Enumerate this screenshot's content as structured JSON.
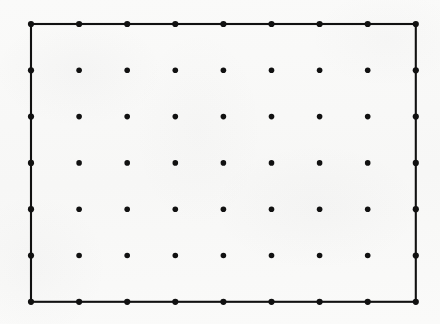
{
  "figure": {
    "kind": "lattice-rectangle-diagram",
    "canvas": {
      "width": 440,
      "height": 324
    },
    "background_color": "#f9f9f8",
    "ink_color": "#111111",
    "lattice": {
      "columns": 9,
      "rows": 7,
      "total_points": 63,
      "x_start": 31,
      "y_start": 24,
      "x_spacing": 48.1,
      "y_spacing": 46.3,
      "x_positions": [
        31,
        79.1,
        127.2,
        175.3,
        223.4,
        271.5,
        319.6,
        367.7,
        415.8
      ],
      "y_positions": [
        24,
        70.3,
        116.6,
        162.9,
        209.2,
        255.5,
        301.8
      ],
      "dot_radius_interior": 2.8,
      "dot_radius_boundary": 3.1
    },
    "rectangle": {
      "left": 31,
      "top": 24,
      "right": 415.8,
      "bottom": 301.8,
      "width": 384.8,
      "height": 277.8,
      "stroke_color": "#111111",
      "stroke_width": 2.1,
      "filled": false
    }
  }
}
